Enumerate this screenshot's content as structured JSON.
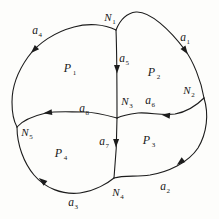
{
  "diagram": {
    "type": "directed-planar-graph",
    "background_color": "#fdfdfb",
    "stroke_color": "#1c1c1c",
    "nodes": [
      {
        "id": "N1",
        "base": "N",
        "sub": "1",
        "x": 110,
        "y": 16
      },
      {
        "id": "N2",
        "base": "N",
        "sub": "2",
        "x": 189,
        "y": 89
      },
      {
        "id": "N3",
        "base": "N",
        "sub": "3",
        "x": 127,
        "y": 100
      },
      {
        "id": "N4",
        "base": "N",
        "sub": "4",
        "x": 118,
        "y": 191
      },
      {
        "id": "N5",
        "base": "N",
        "sub": "5",
        "x": 27,
        "y": 131
      }
    ],
    "arcs": [
      {
        "id": "a1",
        "base": "a",
        "sub": "1",
        "x": 185,
        "y": 36
      },
      {
        "id": "a2",
        "base": "a",
        "sub": "2",
        "x": 165,
        "y": 185
      },
      {
        "id": "a3",
        "base": "a",
        "sub": "3",
        "x": 73,
        "y": 201
      },
      {
        "id": "a4",
        "base": "a",
        "sub": "4",
        "x": 37,
        "y": 29
      },
      {
        "id": "a5",
        "base": "a",
        "sub": "5",
        "x": 124,
        "y": 57
      },
      {
        "id": "a6",
        "base": "a",
        "sub": "6",
        "x": 150,
        "y": 99
      },
      {
        "id": "a7",
        "base": "a",
        "sub": "7",
        "x": 104,
        "y": 140
      },
      {
        "id": "a8",
        "base": "a",
        "sub": "8",
        "x": 84,
        "y": 107
      }
    ],
    "regions": [
      {
        "id": "P1",
        "base": "P",
        "sub": "1",
        "x": 70,
        "y": 67
      },
      {
        "id": "P2",
        "base": "P",
        "sub": "2",
        "x": 154,
        "y": 71
      },
      {
        "id": "P3",
        "base": "P",
        "sub": "3",
        "x": 149,
        "y": 139
      },
      {
        "id": "P4",
        "base": "P",
        "sub": "4",
        "x": 61,
        "y": 152
      }
    ],
    "arrowheads": [
      {
        "arc": "a1",
        "x": 187,
        "y": 53,
        "angle": 55
      },
      {
        "arc": "a2",
        "x": 178,
        "y": 164,
        "angle": 142
      },
      {
        "arc": "a3",
        "x": 40,
        "y": 179,
        "angle": 218
      },
      {
        "arc": "a4",
        "x": 32,
        "y": 52,
        "angle": 135
      },
      {
        "arc": "a5",
        "x": 117,
        "y": 72,
        "angle": 90
      },
      {
        "arc": "a6",
        "x": 163,
        "y": 115,
        "angle": 186
      },
      {
        "arc": "a7",
        "x": 116,
        "y": 146,
        "angle": 91
      },
      {
        "arc": "a8",
        "x": 45,
        "y": 113,
        "angle": 173
      }
    ]
  }
}
